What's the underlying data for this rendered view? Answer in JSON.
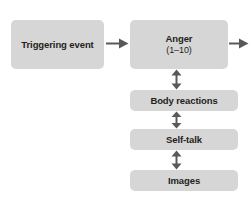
{
  "diagram": {
    "background_color": "#ffffff",
    "node_fill_color": "#d6d6d6",
    "text_color": "#231f20",
    "arrow_color": "#595959",
    "nodes": [
      {
        "id": "trigger",
        "title": "Triggering event",
        "sub": ""
      },
      {
        "id": "anger",
        "title": "Anger",
        "sub": "(1–10)"
      },
      {
        "id": "body",
        "title": "Body reactions",
        "sub": ""
      },
      {
        "id": "selftalk",
        "title": "Self-talk",
        "sub": ""
      },
      {
        "id": "images",
        "title": "Images",
        "sub": ""
      }
    ],
    "arrows": [
      {
        "id": "trigger-anger",
        "from": "trigger",
        "to": "anger",
        "direction": "right",
        "heads": 1
      },
      {
        "id": "anger-out",
        "from": "anger",
        "to": "",
        "direction": "right",
        "heads": 1
      },
      {
        "id": "anger-body",
        "from": "anger",
        "to": "body",
        "direction": "vertical-both",
        "heads": 2
      },
      {
        "id": "body-selftalk",
        "from": "body",
        "to": "selftalk",
        "direction": "vertical-both",
        "heads": 2
      },
      {
        "id": "selftalk-images",
        "from": "selftalk",
        "to": "images",
        "direction": "vertical-both",
        "heads": 2
      }
    ]
  }
}
